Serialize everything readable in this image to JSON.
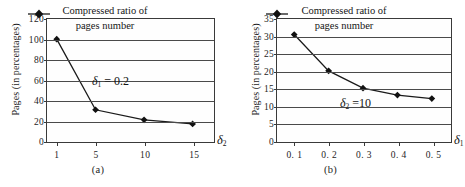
{
  "figure": {
    "background_color": "#ffffff",
    "line_color": "#1a1a1a",
    "grid_color": "#4a4a4a",
    "panels": [
      {
        "id": "a",
        "caption": "(a)",
        "ylabel": "Pages  (in percentages)",
        "x_axis_symbol_base": "δ",
        "x_axis_symbol_sub": "2",
        "legend_line1": "Compressed  ratio  of",
        "legend_line2": "pages number",
        "legend_marker": "diamond-marker",
        "annotation_base": "δ",
        "annotation_sub": "1",
        "annotation_rest": " = 0.2",
        "yticks": [
          "0",
          "20",
          "40",
          "60",
          "80",
          "100",
          "120"
        ],
        "xticks": [
          "1",
          "5",
          "10",
          "15"
        ]
      },
      {
        "id": "b",
        "caption": "(b)",
        "ylabel": "Pages  (in percentages)",
        "x_axis_symbol_base": "δ",
        "x_axis_symbol_sub": "1",
        "legend_line1": "Compressed  ratio  of",
        "legend_line2": "pages number",
        "legend_marker": "diamond-marker",
        "annotation_base": "δ",
        "annotation_sub": "2",
        "annotation_rest": " =10",
        "yticks": [
          "0",
          "5",
          "10",
          "15",
          "20",
          "25",
          "30",
          "35"
        ],
        "xticks": [
          "0. 1",
          "0. 2",
          "0. 3",
          "0. 4",
          "0. 5"
        ]
      }
    ]
  },
  "chart_data": [
    {
      "type": "line",
      "title": "(a)",
      "xlabel": "δ2",
      "ylabel": "Pages  (in percentages)",
      "categories": [
        "1",
        "5",
        "10",
        "15"
      ],
      "x": [
        1,
        5,
        10,
        15
      ],
      "series": [
        {
          "name": "Compressed  ratio  of pages number",
          "values": [
            100,
            30,
            20,
            16
          ]
        }
      ],
      "ylim": [
        0,
        120
      ],
      "yticks": [
        0,
        20,
        40,
        60,
        80,
        100,
        120
      ],
      "xlim": [
        0,
        17
      ],
      "grid": "horizontal",
      "legend_position": "top-center-inside",
      "annotations": [
        "δ1 = 0.2"
      ],
      "marker": "diamond"
    },
    {
      "type": "line",
      "title": "(b)",
      "xlabel": "δ1",
      "ylabel": "Pages  (in percentages)",
      "categories": [
        "0.1",
        "0.2",
        "0.3",
        "0.4",
        "0.5"
      ],
      "x": [
        0.1,
        0.2,
        0.3,
        0.4,
        0.5
      ],
      "series": [
        {
          "name": "Compressed  ratio  of pages number",
          "values": [
            30.5,
            20,
            15,
            13,
            12
          ]
        }
      ],
      "ylim": [
        0,
        35
      ],
      "yticks": [
        0,
        5,
        10,
        15,
        20,
        25,
        30,
        35
      ],
      "xlim": [
        0.05,
        0.55
      ],
      "grid": "horizontal",
      "legend_position": "top-center-inside",
      "annotations": [
        "δ2 =10"
      ],
      "marker": "diamond"
    }
  ]
}
